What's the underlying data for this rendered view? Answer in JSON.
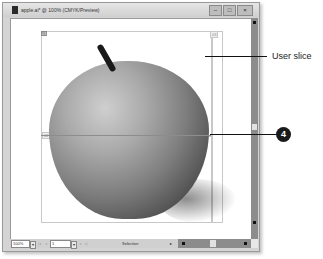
{
  "window": {
    "title": "apple.ai* @ 100% (CMYK/Preview)",
    "buttons": {
      "minimize": "–",
      "maximize": "□",
      "close": "×"
    }
  },
  "canvas": {
    "slices": [
      {
        "label": "01",
        "style": "dark"
      },
      {
        "label": "02",
        "style": "light"
      },
      {
        "label": "03",
        "style": "light"
      }
    ]
  },
  "status_bar": {
    "zoom": "100%",
    "page": "1",
    "status": "Selection"
  },
  "callouts": {
    "user_slice": "User slice",
    "step_number": "4"
  }
}
